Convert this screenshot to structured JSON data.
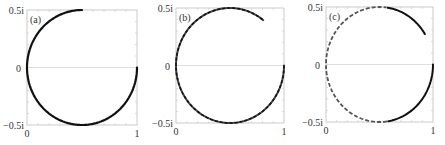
{
  "chart_data": [
    {
      "type": "line",
      "panel_label": "(a)",
      "xlabel": "",
      "ylabel": "",
      "x_ticks": [
        "0",
        "1"
      ],
      "y_ticks": [
        "0.5i",
        "0",
        "-0.5i"
      ],
      "xlim": [
        0,
        1
      ],
      "ylim": [
        -0.5,
        0.5
      ],
      "grid": false,
      "zero_line": true,
      "curve": {
        "description": "circle centered 0.5, radius 0.5 traced from (1,0) clockwise through -0.5i, 0, up to 0.5i",
        "start_angle_deg": 0,
        "end_angle_deg": -270,
        "style": "solid"
      },
      "frame": {
        "x": 27,
        "y": 10,
        "w": 110,
        "h": 115
      }
    },
    {
      "type": "line",
      "panel_label": "(b)",
      "xlabel": "",
      "ylabel": "",
      "x_ticks": [
        "0",
        "1"
      ],
      "y_ticks": [
        "0.5i",
        "0",
        "-0.5i"
      ],
      "xlim": [
        0,
        1
      ],
      "ylim": [
        -0.5,
        0.5
      ],
      "grid": false,
      "zero_line": true,
      "curve": {
        "description": "circle arc from (1,0) clockwise past 0.5i ending near (0.8, 0.4i)",
        "start_angle_deg": 0,
        "end_angle_deg": -308,
        "style": "mottled"
      },
      "frame": {
        "x": 176,
        "y": 8,
        "w": 108,
        "h": 115
      }
    },
    {
      "type": "line",
      "panel_label": "(c)",
      "xlabel": "",
      "ylabel": "",
      "x_ticks": [
        "0",
        "1"
      ],
      "y_ticks": [
        "0.5i",
        "0",
        "-0.5i"
      ],
      "xlim": [
        0,
        1
      ],
      "ylim": [
        -0.5,
        0.5
      ],
      "grid": false,
      "zero_line": true,
      "curve": {
        "description": "circle arc from (1,0) clockwise past 0.5i ending near (0.9, 0.27i)",
        "start_angle_deg": 0,
        "end_angle_deg": -328,
        "style": "dashed-left"
      },
      "frame": {
        "x": 326,
        "y": 7,
        "w": 107,
        "h": 115
      }
    }
  ]
}
